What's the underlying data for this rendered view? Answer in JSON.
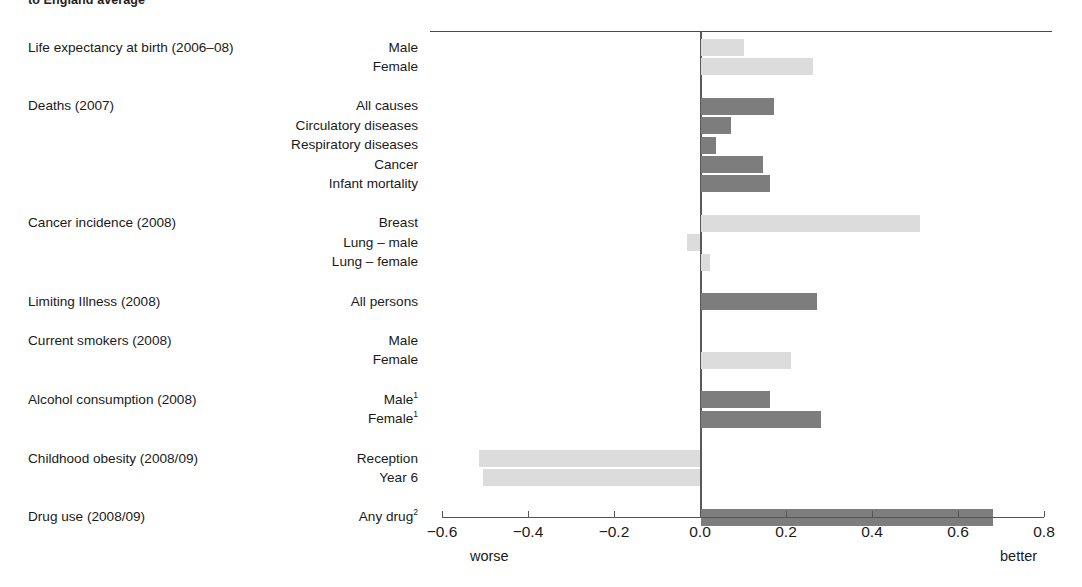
{
  "caption": "to England average",
  "axis": {
    "ticks": [
      "-0.6",
      "-0.4",
      "-0.2",
      "0.0",
      "0.2",
      "0.4",
      "0.6",
      "0.8"
    ],
    "tick_values": [
      -0.6,
      -0.4,
      -0.2,
      0.0,
      0.2,
      0.4,
      0.6,
      0.8
    ],
    "left_end_label": "worse",
    "right_end_label": "better"
  },
  "colors": {
    "dark_bar": "#7d7d7d",
    "light_bar": "#dcdcdc",
    "axis": "#555555",
    "text": "#1a1a1a"
  },
  "groups": [
    {
      "title": "Life expectancy at birth (2006–08)",
      "rows": [
        {
          "label": "Male",
          "value": 0.1
        },
        {
          "label": "Female",
          "value": 0.26
        }
      ]
    },
    {
      "title": "Deaths (2007)",
      "rows": [
        {
          "label": "All causes",
          "value": 0.17
        },
        {
          "label": "Circulatory diseases",
          "value": 0.07
        },
        {
          "label": "Respiratory diseases",
          "value": 0.035
        },
        {
          "label": "Cancer",
          "value": 0.145
        },
        {
          "label": "Infant mortality",
          "value": 0.16
        }
      ]
    },
    {
      "title": "Cancer incidence (2008)",
      "rows": [
        {
          "label": "Breast",
          "value": 0.51
        },
        {
          "label": "Lung – male",
          "value": -0.03
        },
        {
          "label": "Lung – female",
          "value": 0.02
        }
      ]
    },
    {
      "title": "Limiting Illness (2008)",
      "rows": [
        {
          "label": "All persons",
          "value": 0.27
        }
      ]
    },
    {
      "title": "Current smokers (2008)",
      "rows": [
        {
          "label": "Male",
          "value": 0.0
        },
        {
          "label": "Female",
          "value": 0.21
        }
      ]
    },
    {
      "title": "Alcohol consumption (2008)",
      "rows": [
        {
          "label": "Male",
          "sup": "1",
          "value": 0.16
        },
        {
          "label": "Female",
          "sup": "1",
          "value": 0.28
        }
      ]
    },
    {
      "title": "Childhood obesity (2008/09)",
      "rows": [
        {
          "label": "Reception",
          "value": -0.515
        },
        {
          "label": "Year 6",
          "value": -0.505
        }
      ]
    },
    {
      "title": "Drug use (2008/09)",
      "rows": [
        {
          "label": "Any drug",
          "sup": "2",
          "value": 0.68
        }
      ]
    }
  ],
  "chart_data": {
    "type": "bar",
    "orientation": "horizontal",
    "title": "to England average",
    "xlabel": "",
    "ylabel": "",
    "xlim": [
      -0.6,
      0.8
    ],
    "xticks": [
      -0.6,
      -0.4,
      -0.2,
      0.0,
      0.2,
      0.4,
      0.6,
      0.8
    ],
    "grid": false,
    "legend": "none",
    "annotations": [
      "worse",
      "better"
    ],
    "categories": [
      "Life expectancy at birth (2006–08) – Male",
      "Life expectancy at birth (2006–08) – Female",
      "Deaths (2007) – All causes",
      "Deaths (2007) – Circulatory diseases",
      "Deaths (2007) – Respiratory diseases",
      "Deaths (2007) – Cancer",
      "Deaths (2007) – Infant mortality",
      "Cancer incidence (2008) – Breast",
      "Cancer incidence (2008) – Lung – male",
      "Cancer incidence (2008) – Lung – female",
      "Limiting Illness (2008) – All persons",
      "Current smokers (2008) – Male",
      "Current smokers (2008) – Female",
      "Alcohol consumption (2008) – Male",
      "Alcohol consumption (2008) – Female",
      "Childhood obesity (2008/09) – Reception",
      "Childhood obesity (2008/09) – Year 6",
      "Drug use (2008/09) – Any drug"
    ],
    "values": [
      0.1,
      0.26,
      0.17,
      0.07,
      0.035,
      0.145,
      0.16,
      0.51,
      -0.03,
      0.02,
      0.27,
      0.0,
      0.21,
      0.16,
      0.28,
      -0.515,
      -0.505,
      0.68
    ],
    "bar_shades": [
      "light",
      "light",
      "dark",
      "dark",
      "dark",
      "dark",
      "dark",
      "light",
      "light",
      "light",
      "dark",
      "light",
      "light",
      "dark",
      "dark",
      "light",
      "light",
      "dark"
    ]
  }
}
